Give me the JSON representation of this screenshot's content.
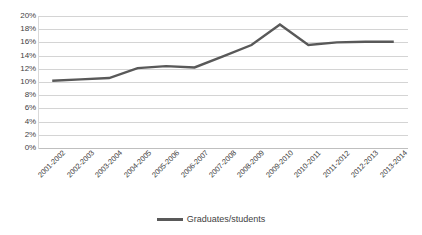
{
  "chart_data": {
    "type": "line",
    "title": "",
    "xlabel": "",
    "ylabel": "",
    "ylim": [
      0,
      20
    ],
    "ytick_labels": [
      "20%",
      "18%",
      "16%",
      "14%",
      "12%",
      "10%",
      "8%",
      "6%",
      "4%",
      "2%",
      "0%"
    ],
    "ytick_values": [
      20,
      18,
      16,
      14,
      12,
      10,
      8,
      6,
      4,
      2,
      0
    ],
    "grid": true,
    "legend_position": "bottom",
    "categories": [
      "2001-2002",
      "2002-2003",
      "2003-2004",
      "2004-2005",
      "2005-2006",
      "2006-2007",
      "2007-2008",
      "2008-2009",
      "2009-2010",
      "2010-2011",
      "2011-2012",
      "2012-2013",
      "2013-2014"
    ],
    "series": [
      {
        "name": "Graduates/students",
        "color": "#595959",
        "values": [
          10.2,
          10.4,
          10.6,
          12.1,
          12.4,
          12.2,
          13.9,
          15.6,
          18.7,
          15.6,
          16.0,
          16.1,
          16.1
        ]
      }
    ]
  },
  "legend": {
    "entries": [
      {
        "label": "Graduates/students",
        "marker": "line-swatch"
      }
    ]
  },
  "colors": {
    "series_line": "#595959",
    "gridline": "#d4d4d4",
    "axis": "#bfbfbf",
    "text": "#3f3f3f",
    "background": "#ffffff"
  }
}
